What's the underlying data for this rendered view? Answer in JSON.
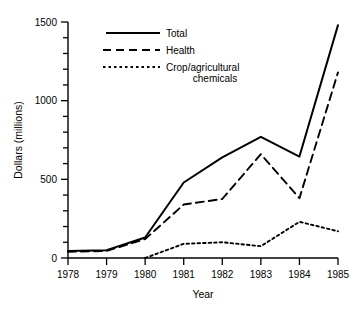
{
  "chart_data": {
    "type": "line",
    "title": "",
    "xlabel": "Year",
    "ylabel": "Dollars (millions)",
    "categories": [
      1978,
      1979,
      1980,
      1981,
      1982,
      1983,
      1984,
      1985
    ],
    "xtick_labels": [
      "1978",
      "1979",
      "1980",
      "1981",
      "1982",
      "1983",
      "1984",
      "1985"
    ],
    "ytick_labels": [
      "0",
      "500",
      "1000",
      "1500"
    ],
    "yticks": [
      0,
      500,
      1000,
      1500
    ],
    "yminor_step": 100,
    "xlim": [
      1978,
      1985
    ],
    "ylim": [
      0,
      1500
    ],
    "grid": false,
    "legend_position": "top-left-inside",
    "series": [
      {
        "name": "Total",
        "style": "solid",
        "color": "#000000",
        "values": [
          45,
          50,
          130,
          480,
          640,
          770,
          645,
          1480
        ]
      },
      {
        "name": "Health",
        "style": "dashed",
        "color": "#000000",
        "values": [
          40,
          45,
          120,
          340,
          375,
          660,
          380,
          1180
        ]
      },
      {
        "name": "Crop/agricultural chemicals",
        "style": "dotted",
        "color": "#000000",
        "values": [
          null,
          null,
          0,
          90,
          100,
          75,
          230,
          170
        ]
      }
    ]
  },
  "legend": {
    "items": [
      {
        "label": "Total",
        "style": "solid"
      },
      {
        "label": "Health",
        "style": "dashed"
      },
      {
        "label": "Crop/agricultural",
        "label2": "chemicals",
        "style": "dotted"
      }
    ]
  },
  "axis": {
    "y_title": "Dollars (millions)",
    "x_title": "Year",
    "y_labels": [
      "1500",
      "1000",
      "500",
      "0"
    ],
    "x_labels": [
      "1978",
      "1979",
      "1980",
      "1981",
      "1982",
      "1983",
      "1984",
      "1985"
    ]
  }
}
